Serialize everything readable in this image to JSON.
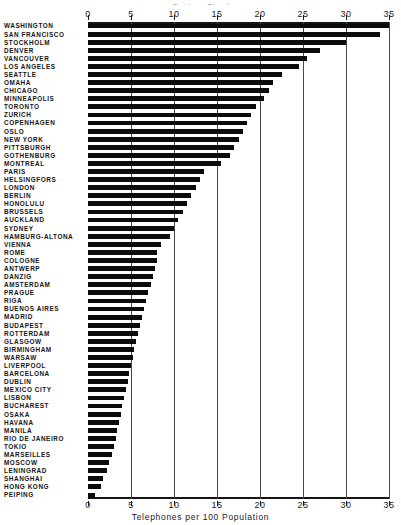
{
  "title_cutoff": "Century Chart",
  "axis": {
    "x_caption": "Telephones per 100 Population",
    "ticks": [
      "0",
      "5",
      "10",
      "15",
      "20",
      "25",
      "30",
      "35"
    ]
  },
  "colors": {
    "bar": "#0b0b0b",
    "grid": "#4a4a4a",
    "frame": "#141414",
    "background": "#ffffff",
    "text": "#151515"
  },
  "chart_data": {
    "type": "bar",
    "orientation": "horizontal",
    "title": "Telephones per 100 Population",
    "xlabel": "Telephones per 100 Population",
    "ylabel": "",
    "xlim": [
      0,
      35
    ],
    "xticks": [
      0,
      5,
      10,
      15,
      20,
      25,
      30,
      35
    ],
    "grid": true,
    "legend": "none",
    "categories": [
      "WASHINGTON",
      "SAN FRANCISCO",
      "STOCKHOLM",
      "DENVER",
      "VANCOUVER",
      "LOS ANGELES",
      "SEATTLE",
      "OMAHA",
      "CHICAGO",
      "MINNEAPOLIS",
      "TORONTO",
      "ZURICH",
      "COPENHAGEN",
      "OSLO",
      "NEW YORK",
      "PITTSBURGH",
      "GOTHENBURG",
      "MONTREAL",
      "PARIS",
      "HELSINGFORS",
      "LONDON",
      "BERLIN",
      "HONOLULU",
      "BRUSSELS",
      "AUCKLAND",
      "SYDNEY",
      "HAMBURG-ALTONA",
      "VIENNA",
      "ROME",
      "COLOGNE",
      "ANTWERP",
      "DANZIG",
      "AMSTERDAM",
      "PRAGUE",
      "RIGA",
      "BUENOS AIRES",
      "MADRID",
      "BUDAPEST",
      "ROTTERDAM",
      "GLASGOW",
      "BIRMINGHAM",
      "WARSAW",
      "LIVERPOOL",
      "BARCELONA",
      "DUBLIN",
      "MEXICO CITY",
      "LISBON",
      "BUCHAREST",
      "OSAKA",
      "HAVANA",
      "MANILA",
      "RIO DE JANEIRO",
      "TOKIO",
      "MARSEILLES",
      "MOSCOW",
      "LENINGRAD",
      "SHANGHAI",
      "HONG KONG",
      "PEIPING"
    ],
    "values": [
      35.5,
      34.0,
      30.0,
      27.0,
      25.5,
      24.5,
      22.5,
      21.5,
      21.0,
      20.5,
      19.5,
      19.0,
      18.5,
      18.0,
      17.5,
      17.0,
      16.5,
      15.5,
      13.5,
      13.0,
      12.5,
      12.0,
      11.5,
      11.0,
      10.5,
      10.0,
      9.5,
      8.5,
      8.0,
      8.0,
      7.8,
      7.5,
      7.3,
      7.0,
      6.8,
      6.5,
      6.3,
      6.0,
      5.8,
      5.6,
      5.4,
      5.2,
      5.0,
      4.8,
      4.6,
      4.4,
      4.2,
      4.0,
      3.8,
      3.6,
      3.4,
      3.2,
      3.0,
      2.8,
      2.4,
      2.2,
      1.8,
      1.5,
      0.8
    ],
    "units": "telephones per 100 population"
  }
}
